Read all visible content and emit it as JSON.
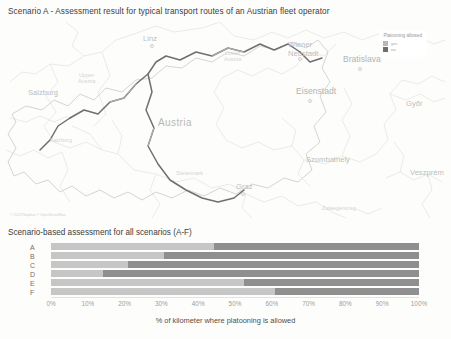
{
  "map_panel": {
    "title": "Scenario A - Assessment result for typical transport routes of an Austrian fleet operator",
    "attribution": "© 2023 Mapbox © OpenStreetMap",
    "legend": {
      "title": "Platooning allowed",
      "items": [
        {
          "label": "yes",
          "color": "#b8b8b8"
        },
        {
          "label": "no",
          "color": "#6e6e6e"
        }
      ]
    },
    "labels": [
      {
        "name": "Linz",
        "kind": "city",
        "x": 143,
        "y": 18,
        "dot": true
      },
      {
        "name": "Upper\nAustria",
        "kind": "region",
        "x": 88,
        "y": 55,
        "dot": false
      },
      {
        "name": "Lower\nAustria",
        "kind": "region",
        "x": 232,
        "y": 33,
        "dot": false
      },
      {
        "name": "Salzburg",
        "kind": "city",
        "x": 34,
        "y": 70,
        "dot": false
      },
      {
        "name": "Salzburg",
        "kind": "region",
        "x": 56,
        "y": 118,
        "dot": false
      },
      {
        "name": "Austria",
        "kind": "country",
        "x": 175,
        "y": 100,
        "dot": false
      },
      {
        "name": "Wiener\nNeustadt",
        "kind": "city",
        "x": 294,
        "y": 24,
        "dot": true
      },
      {
        "name": "Bratislava",
        "kind": "city-big",
        "x": 350,
        "y": 37,
        "dot": true
      },
      {
        "name": "Eisenstadt",
        "kind": "city",
        "x": 305,
        "y": 70,
        "dot": true
      },
      {
        "name": "Steiermark",
        "kind": "region",
        "x": 182,
        "y": 152,
        "dot": false
      },
      {
        "name": "Graz",
        "kind": "city",
        "x": 238,
        "y": 165,
        "dot": true
      },
      {
        "name": "Szombathely",
        "kind": "city",
        "x": 318,
        "y": 137,
        "dot": false
      },
      {
        "name": "Győr",
        "kind": "city",
        "x": 408,
        "y": 81,
        "dot": false
      },
      {
        "name": "Veszprém",
        "kind": "city",
        "x": 418,
        "y": 150,
        "dot": false
      },
      {
        "name": "Zalaegerszeg",
        "kind": "city",
        "x": 333,
        "y": 185,
        "dot": false
      }
    ]
  },
  "chart_panel": {
    "title": "Scenario-based assessment for all scenarios (A-F)"
  },
  "chart_data": {
    "type": "bar",
    "subtype": "stacked-horizontal-100",
    "title": "Scenario-based assessment for all scenarios (A-F)",
    "categories": [
      "A",
      "B",
      "C",
      "D",
      "E",
      "F"
    ],
    "series": [
      {
        "name": "yes",
        "color": "#c6c6c6",
        "values": [
          44.4,
          30.6,
          21.0,
          14.0,
          52.5,
          61.0
        ]
      },
      {
        "name": "no",
        "color": "#8f8f8f",
        "values": [
          55.6,
          69.4,
          79.0,
          86.0,
          47.5,
          39.0
        ]
      }
    ],
    "xlabel": "% of kilometer where platooning is allowed",
    "ylabel": "",
    "xlim": [
      0,
      100
    ],
    "xticks": [
      "0%",
      "10%",
      "20%",
      "30%",
      "40%",
      "50%",
      "60%",
      "70%",
      "80%",
      "90%",
      "100%"
    ],
    "grid": false,
    "legend_position": "none"
  }
}
